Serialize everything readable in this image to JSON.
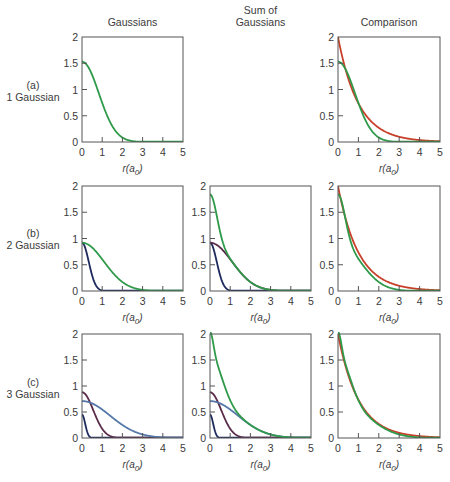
{
  "figure": {
    "column_titles": [
      "Gaussians",
      "Sum of\nGaussians",
      "Comparison"
    ],
    "row_labels": [
      {
        "tag": "(a)",
        "label": "1 Gaussian"
      },
      {
        "tag": "(b)",
        "label": "2 Gaussian"
      },
      {
        "tag": "(c)",
        "label": "3 Gaussian"
      }
    ],
    "xlabel": "r(a0)",
    "colors": {
      "sto": "#c8402a",
      "sum": "#2e9a4a",
      "g1": "#2e9a4a",
      "g_narrow": "#1e2a5e",
      "g_mid": "#5a2a4a",
      "g_wide": "#5578a8",
      "frame": "#555555"
    }
  },
  "chart_data": [
    {
      "type": "line",
      "row": "(a) 1 Gaussian",
      "column": "Gaussians",
      "xlabel": "r(a0)",
      "ylabel": "",
      "xlim": [
        0,
        5
      ],
      "ylim": [
        0,
        2
      ],
      "xticks": [
        0,
        1,
        2,
        3,
        4,
        5
      ],
      "yticks": [
        0,
        0.5,
        1,
        1.5,
        2
      ],
      "series": [
        {
          "name": "Gaussian 1",
          "color": "#2e9a4a",
          "amp": 1.53,
          "alpha": 0.72
        }
      ]
    },
    {
      "type": "line",
      "row": "(a) 1 Gaussian",
      "column": "Comparison",
      "xlabel": "r(a0)",
      "ylabel": "",
      "xlim": [
        0,
        5
      ],
      "ylim": [
        0,
        2
      ],
      "xticks": [
        0,
        1,
        2,
        3,
        4,
        5
      ],
      "yticks": [
        0,
        0.5,
        1,
        1.5,
        2
      ],
      "series": [
        {
          "name": "Slater (exp)",
          "color": "#c8402a",
          "kind": "sto",
          "amp": 2.0,
          "zeta": 1.0
        },
        {
          "name": "Sum of Gaussians",
          "color": "#2e9a4a",
          "gaussians": [
            [
              1.53,
              0.72
            ]
          ]
        }
      ]
    },
    {
      "type": "line",
      "row": "(b) 2 Gaussian",
      "column": "Gaussians",
      "xlabel": "r(a0)",
      "ylabel": "",
      "xlim": [
        0,
        5
      ],
      "ylim": [
        0,
        2
      ],
      "xticks": [
        0,
        1,
        2,
        3,
        4,
        5
      ],
      "yticks": [
        0,
        0.5,
        1,
        1.5,
        2
      ],
      "series": [
        {
          "name": "Gaussian narrow",
          "color": "#1e2a5e",
          "amp": 0.92,
          "alpha": 4.5
        },
        {
          "name": "Gaussian wide",
          "color": "#2e9a4a",
          "amp": 0.92,
          "alpha": 0.42
        }
      ]
    },
    {
      "type": "line",
      "row": "(b) 2 Gaussian",
      "column": "Sum of Gaussians",
      "xlabel": "r(a0)",
      "ylabel": "",
      "xlim": [
        0,
        5
      ],
      "ylim": [
        0,
        2
      ],
      "xticks": [
        0,
        1,
        2,
        3,
        4,
        5
      ],
      "yticks": [
        0,
        0.5,
        1,
        1.5,
        2
      ],
      "series": [
        {
          "name": "Gaussian narrow",
          "color": "#1e2a5e",
          "amp": 0.92,
          "alpha": 4.5
        },
        {
          "name": "Gaussian wide",
          "color": "#5a2a4a",
          "amp": 0.92,
          "alpha": 0.42
        },
        {
          "name": "Sum",
          "color": "#2e9a4a",
          "gaussians": [
            [
              0.92,
              4.5
            ],
            [
              0.92,
              0.42
            ]
          ]
        }
      ]
    },
    {
      "type": "line",
      "row": "(b) 2 Gaussian",
      "column": "Comparison",
      "xlabel": "r(a0)",
      "ylabel": "",
      "xlim": [
        0,
        5
      ],
      "ylim": [
        0,
        2
      ],
      "xticks": [
        0,
        1,
        2,
        3,
        4,
        5
      ],
      "yticks": [
        0,
        0.5,
        1,
        1.5,
        2
      ],
      "series": [
        {
          "name": "Slater (exp)",
          "color": "#c8402a",
          "kind": "sto",
          "amp": 2.0,
          "zeta": 1.0
        },
        {
          "name": "Sum of Gaussians",
          "color": "#2e9a4a",
          "gaussians": [
            [
              0.92,
              4.5
            ],
            [
              0.92,
              0.42
            ]
          ]
        }
      ]
    },
    {
      "type": "line",
      "row": "(c) 3 Gaussian",
      "column": "Gaussians",
      "xlabel": "r(a0)",
      "ylabel": "",
      "xlim": [
        0,
        5
      ],
      "ylim": [
        0,
        2
      ],
      "xticks": [
        0,
        1,
        2,
        3,
        4,
        5
      ],
      "yticks": [
        0,
        0.5,
        1,
        1.5,
        2
      ],
      "series": [
        {
          "name": "Gaussian narrow",
          "color": "#1e2a5e",
          "amp": 0.45,
          "alpha": 20.0
        },
        {
          "name": "Gaussian mid",
          "color": "#5a2a4a",
          "amp": 0.88,
          "alpha": 1.6
        },
        {
          "name": "Gaussian wide",
          "color": "#5578a8",
          "amp": 0.71,
          "alpha": 0.26
        }
      ]
    },
    {
      "type": "line",
      "row": "(c) 3 Gaussian",
      "column": "Sum of Gaussians",
      "xlabel": "r(a0)",
      "ylabel": "",
      "xlim": [
        0,
        5
      ],
      "ylim": [
        0,
        2
      ],
      "xticks": [
        0,
        1,
        2,
        3,
        4,
        5
      ],
      "yticks": [
        0,
        0.5,
        1,
        1.5,
        2
      ],
      "series": [
        {
          "name": "Gaussian narrow",
          "color": "#1e2a5e",
          "amp": 0.45,
          "alpha": 20.0
        },
        {
          "name": "Gaussian mid",
          "color": "#5a2a4a",
          "amp": 0.88,
          "alpha": 1.6
        },
        {
          "name": "Gaussian wide",
          "color": "#5578a8",
          "amp": 0.71,
          "alpha": 0.26
        },
        {
          "name": "Sum",
          "color": "#2e9a4a",
          "gaussians": [
            [
              0.45,
              20.0
            ],
            [
              0.88,
              1.6
            ],
            [
              0.71,
              0.26
            ]
          ]
        }
      ]
    },
    {
      "type": "line",
      "row": "(c) 3 Gaussian",
      "column": "Comparison",
      "xlabel": "r(a0)",
      "ylabel": "",
      "xlim": [
        0,
        5
      ],
      "ylim": [
        0,
        2
      ],
      "xticks": [
        0,
        1,
        2,
        3,
        4,
        5
      ],
      "yticks": [
        0,
        0.5,
        1,
        1.5,
        2
      ],
      "series": [
        {
          "name": "Slater (exp)",
          "color": "#c8402a",
          "kind": "sto",
          "amp": 2.0,
          "zeta": 1.0
        },
        {
          "name": "Sum of Gaussians",
          "color": "#2e9a4a",
          "gaussians": [
            [
              0.45,
              20.0
            ],
            [
              0.88,
              1.6
            ],
            [
              0.71,
              0.26
            ]
          ]
        }
      ]
    }
  ]
}
